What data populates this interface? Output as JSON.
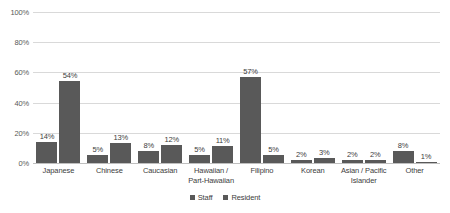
{
  "chart_data": {
    "type": "bar",
    "title": "",
    "xlabel": "",
    "ylabel": "",
    "ylim": [
      0,
      100
    ],
    "yticks": [
      "0%",
      "20%",
      "40%",
      "60%",
      "80%",
      "100%"
    ],
    "ytick_values": [
      0,
      20,
      40,
      60,
      80,
      100
    ],
    "grid": "horizontal",
    "legend_position": "bottom-center",
    "categories": [
      "Japanese",
      "Chinese",
      "Caucasian",
      "Hawaiian /\nPart-Hawaiian",
      "Filipino",
      "Korean",
      "Asian / Pacific\nIslander",
      "Other"
    ],
    "category_lines": [
      [
        "Japanese"
      ],
      [
        "Chinese"
      ],
      [
        "Caucasian"
      ],
      [
        "Hawaiian /",
        "Part-Hawaiian"
      ],
      [
        "Filipino"
      ],
      [
        "Korean"
      ],
      [
        "Asian / Pacific",
        "Islander"
      ],
      [
        "Other"
      ]
    ],
    "series": [
      {
        "name": "Staff",
        "color": "#595959",
        "values": [
          14,
          5,
          8,
          5,
          57,
          2,
          2,
          8
        ],
        "labels": [
          "14%",
          "5%",
          "8%",
          "5%",
          "57%",
          "2%",
          "2%",
          "8%"
        ]
      },
      {
        "name": "Resident",
        "color": "#595959",
        "values": [
          54,
          13,
          12,
          11,
          5,
          3,
          2,
          1
        ],
        "labels": [
          "54%",
          "13%",
          "12%",
          "11%",
          "5%",
          "3%",
          "2%",
          "1%"
        ]
      }
    ]
  },
  "legend": {
    "items": [
      {
        "label": "Staff",
        "color": "#595959"
      },
      {
        "label": "Resident",
        "color": "#595959"
      }
    ]
  },
  "colors": {
    "bar": "#595959",
    "gridline": "#d9d9d9",
    "baseline": "#bfbfbf",
    "text": "#404040",
    "axis_text": "#595959",
    "background": "#ffffff"
  }
}
